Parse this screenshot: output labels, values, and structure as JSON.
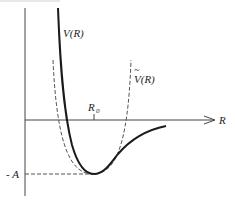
{
  "diagram": {
    "type": "potential-energy-curve",
    "labels": {
      "true_potential": "V(R)",
      "harmonic_approx": "V(R)",
      "harmonic_approx_accent": "~",
      "equilibrium": "R",
      "equilibrium_sub": "0",
      "x_axis": "R",
      "well_depth": "- A"
    },
    "colors": {
      "curve": "#1a1a1a",
      "dashed": "#555555",
      "axis": "#333333"
    }
  }
}
